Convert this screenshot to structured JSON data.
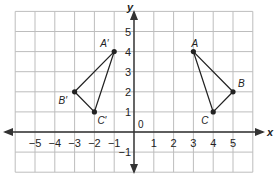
{
  "diagram": {
    "type": "coordinate-plane-reflection",
    "axes": {
      "x_label": "x",
      "y_label": "y",
      "origin_label": "0",
      "x_ticks": [
        "−5",
        "−4",
        "−3",
        "−2",
        "−1",
        "1",
        "2",
        "3",
        "4",
        "5"
      ],
      "y_ticks": [
        "5",
        "4",
        "3",
        "2",
        "1",
        "−1"
      ],
      "x_range": [
        -6,
        6
      ],
      "y_range": [
        -2,
        6
      ]
    },
    "triangles": [
      {
        "name": "ABC",
        "points": [
          {
            "label": "A",
            "x": 3,
            "y": 4
          },
          {
            "label": "B",
            "x": 5,
            "y": 2
          },
          {
            "label": "C",
            "x": 4,
            "y": 1
          }
        ]
      },
      {
        "name": "A'B'C'",
        "points": [
          {
            "label": "A′",
            "x": -1,
            "y": 4
          },
          {
            "label": "B′",
            "x": -3,
            "y": 2
          },
          {
            "label": "C′",
            "x": -2,
            "y": 1
          }
        ]
      }
    ],
    "colors": {
      "grid": "#bdbdbd",
      "axis": "#333333",
      "shape": "#222222"
    }
  }
}
